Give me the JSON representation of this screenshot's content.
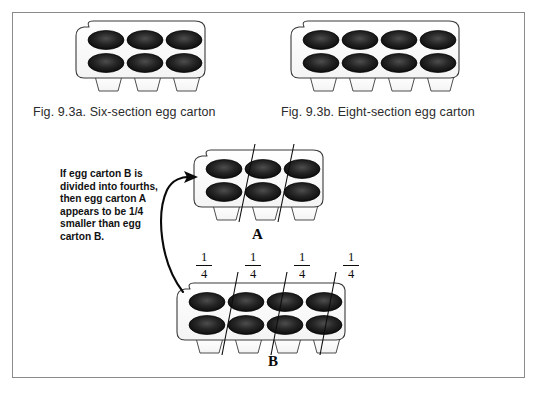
{
  "figure": {
    "title_caption_a": "Fig. 9.3a. Six-section egg carton",
    "title_caption_b": "Fig. 9.3b. Eight-section egg carton",
    "annotation": "If egg carton B is divided into fourths, then egg carton A appears to be 1/4 smaller than egg carton B.",
    "label_a": "A",
    "label_b": "B",
    "fractions": [
      {
        "numerator": "1",
        "denominator": "4"
      },
      {
        "numerator": "1",
        "denominator": "4"
      },
      {
        "numerator": "1",
        "denominator": "4"
      },
      {
        "numerator": "1",
        "denominator": "4"
      }
    ],
    "cartons": {
      "top_left": {
        "name": "six-section-egg-carton",
        "cups": 6,
        "columns": 3,
        "rows": 2,
        "legs": 3,
        "dividers": 0
      },
      "top_right": {
        "name": "eight-section-egg-carton",
        "cups": 8,
        "columns": 4,
        "rows": 2,
        "legs": 4,
        "dividers": 0
      },
      "middle_a": {
        "name": "carton-a-six-section",
        "cups": 6,
        "columns": 3,
        "rows": 2,
        "legs": 3,
        "dividers": 2
      },
      "bottom_b": {
        "name": "carton-b-eight-section",
        "cups": 8,
        "columns": 4,
        "rows": 2,
        "legs": 4,
        "dividers": 3
      }
    },
    "colors": {
      "page_border": "#8a8a8a",
      "carton_outline": "#3a3a3a",
      "cup_fill": "#121212",
      "cup_highlight": "#4a4a4a",
      "divider_line": "#0d0d0d",
      "arrow": "#0a0a0a",
      "background": "#ffffff"
    }
  }
}
